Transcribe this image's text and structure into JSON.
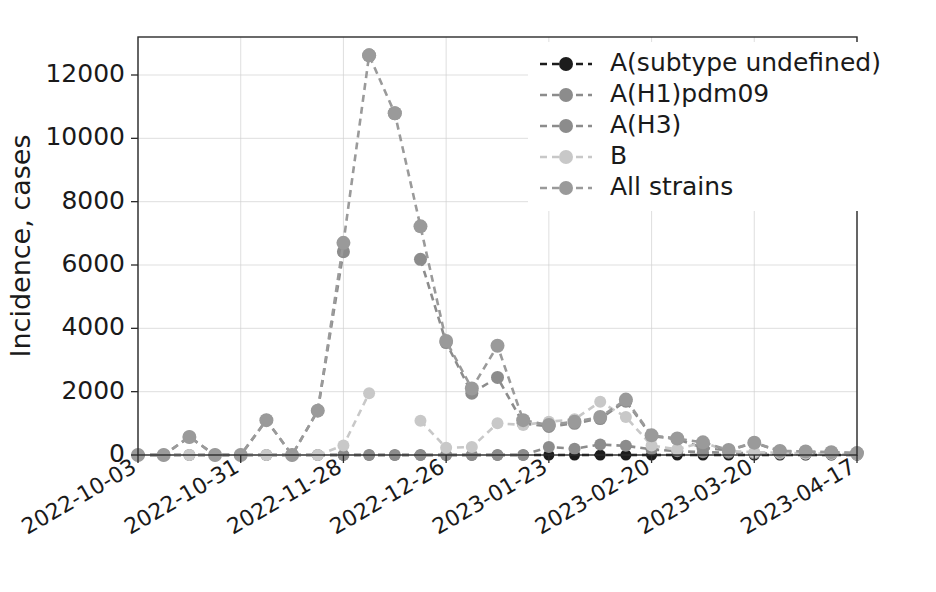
{
  "figure": {
    "width": 936,
    "height": 592,
    "background": "#ffffff"
  },
  "axes": {
    "left": 138,
    "top": 37,
    "right": 857,
    "bottom": 455
  },
  "chart_data": {
    "type": "line",
    "title": "",
    "xlabel": "",
    "ylabel": "Incidence, cases",
    "ylim": [
      0,
      13200
    ],
    "yticks": [
      0,
      2000,
      4000,
      6000,
      8000,
      10000,
      12000
    ],
    "ytick_labels": [
      "0",
      "2000",
      "4000",
      "6000",
      "8000",
      "10000",
      "12000"
    ],
    "grid": true,
    "legend_position": "upper right",
    "x": [
      "2022-10-03",
      "2022-10-10",
      "2022-10-17",
      "2022-10-24",
      "2022-10-31",
      "2022-11-07",
      "2022-11-14",
      "2022-11-21",
      "2022-11-28",
      "2022-12-05",
      "2022-12-12",
      "2022-12-19",
      "2022-12-26",
      "2023-01-02",
      "2023-01-09",
      "2023-01-16",
      "2023-01-23",
      "2023-01-30",
      "2023-02-06",
      "2023-02-13",
      "2023-02-20",
      "2023-02-27",
      "2023-03-06",
      "2023-03-13",
      "2023-03-20",
      "2023-03-27",
      "2023-04-03",
      "2023-04-10",
      "2023-04-17"
    ],
    "xtick_labels": [
      "2022-10-03",
      "2022-10-31",
      "2022-11-28",
      "2022-12-26",
      "2023-01-23",
      "2023-02-20",
      "2023-03-20",
      "2023-04-17"
    ],
    "xtick_indices": [
      0,
      4,
      8,
      12,
      16,
      20,
      24,
      28
    ],
    "series": [
      {
        "name": "A(subtype undefined)",
        "color": "#1c1c1c",
        "marker_size": 11,
        "values": [
          0,
          0,
          0,
          0,
          0,
          0,
          0,
          0,
          0,
          0,
          0,
          0,
          0,
          0,
          0,
          0,
          0,
          0,
          0,
          0,
          0,
          0,
          0,
          0,
          0,
          0,
          0,
          0,
          0
        ]
      },
      {
        "name": "A(H1)pdm09",
        "color": "#8c8c8c",
        "marker_size": 12,
        "values": [
          0,
          0,
          0,
          0,
          0,
          0,
          0,
          0,
          0,
          0,
          0,
          0,
          0,
          0,
          0,
          0,
          250,
          200,
          330,
          290,
          180,
          120,
          90,
          70,
          50,
          40,
          30,
          20,
          10
        ]
      },
      {
        "name": "A(H3)",
        "color": "#8c8c8c",
        "marker_size": 13,
        "values": [
          0,
          0,
          570,
          0,
          0,
          1100,
          0,
          1400,
          6420,
          null,
          null,
          6180,
          3550,
          1950,
          2450,
          1000,
          900,
          1000,
          1150,
          1700,
          600,
          500,
          230,
          150,
          380,
          120,
          100,
          80,
          60
        ]
      },
      {
        "name": "B",
        "color": "#c8c8c8",
        "marker_size": 12,
        "values": [
          0,
          0,
          0,
          0,
          0,
          0,
          0,
          0,
          300,
          1950,
          null,
          1080,
          230,
          250,
          1000,
          950,
          1050,
          1130,
          1680,
          1200,
          300,
          180,
          400,
          120,
          90,
          70,
          50,
          40,
          20
        ]
      },
      {
        "name": "All strains",
        "color": "#9a9a9a",
        "marker_size": 14,
        "values": [
          0,
          0,
          570,
          0,
          0,
          1100,
          0,
          1400,
          6700,
          12620,
          10790,
          7220,
          3600,
          2100,
          3450,
          1100,
          950,
          1050,
          1200,
          1750,
          620,
          520,
          400,
          160,
          390,
          130,
          110,
          90,
          60
        ]
      }
    ],
    "disconnected_points": [
      {
        "series": "All strains",
        "x": "2022-12-05",
        "y": 12620
      },
      {
        "series": "All strains",
        "x": "2022-12-12",
        "y": 10790
      }
    ]
  },
  "legend": {
    "entries": [
      {
        "label": "A(subtype undefined)",
        "color": "#1c1c1c"
      },
      {
        "label": "A(H1)pdm09",
        "color": "#8c8c8c"
      },
      {
        "label": "A(H3)",
        "color": "#8c8c8c"
      },
      {
        "label": "B",
        "color": "#c8c8c8"
      },
      {
        "label": "All strains",
        "color": "#9a9a9a"
      }
    ]
  }
}
